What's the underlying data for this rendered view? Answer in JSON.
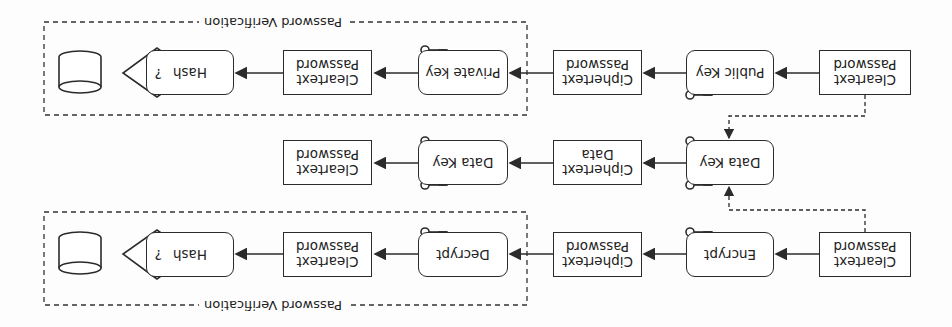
{
  "diagram": {
    "orientation": "rotated-180",
    "rows": [
      {
        "id": "asymmetric",
        "nodes": [
          {
            "id": "a1",
            "label": "Cleartext Password",
            "shape": "rect"
          },
          {
            "id": "a2",
            "label": "Public Key",
            "shape": "rounded",
            "key_icon": true
          },
          {
            "id": "a3",
            "label": "Ciphertext Password",
            "shape": "rect"
          },
          {
            "id": "a4",
            "label": "Private key",
            "shape": "rounded",
            "key_icon": true
          },
          {
            "id": "a5",
            "label": "Cleartext Password",
            "shape": "rect"
          },
          {
            "id": "a6",
            "label": "Hash",
            "shape": "rounded"
          },
          {
            "id": "a7",
            "label": "?",
            "shape": "diamond"
          },
          {
            "id": "a8",
            "label": "",
            "shape": "cylinder"
          }
        ],
        "group_label": "Password Verification"
      },
      {
        "id": "envelope",
        "nodes": [
          {
            "id": "b1",
            "label": "Data Key",
            "shape": "rounded",
            "key_icon": true
          },
          {
            "id": "b2",
            "label": "Ciphertext Data",
            "shape": "rect"
          },
          {
            "id": "b3",
            "label": "Data Key",
            "shape": "rounded",
            "key_icon": true
          },
          {
            "id": "b4",
            "label": "Cleartext Password",
            "shape": "rect"
          }
        ]
      },
      {
        "id": "symmetric",
        "nodes": [
          {
            "id": "c1",
            "label": "Cleartext Password",
            "shape": "rect"
          },
          {
            "id": "c2",
            "label": "Encrypt",
            "shape": "rounded",
            "key_icon": true
          },
          {
            "id": "c3",
            "label": "Ciphertext Password",
            "shape": "rect"
          },
          {
            "id": "c4",
            "label": "Decrypt",
            "shape": "rounded",
            "key_icon": true
          },
          {
            "id": "c5",
            "label": "Cleartext Password",
            "shape": "rect"
          },
          {
            "id": "c6",
            "label": "Hash",
            "shape": "rounded"
          },
          {
            "id": "c7",
            "label": "?",
            "shape": "diamond"
          },
          {
            "id": "c8",
            "label": "",
            "shape": "cylinder"
          }
        ],
        "group_label": "Password Verification"
      }
    ],
    "colors": {
      "stroke": "#2b2b2b",
      "background": "#fdfdfd"
    }
  }
}
